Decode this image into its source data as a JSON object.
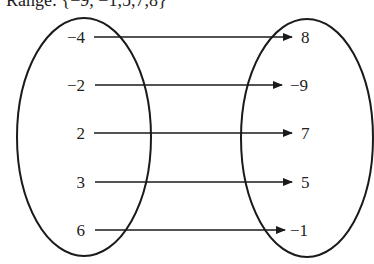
{
  "header": {
    "text": "Range: {−9, −1,5,7,8}"
  },
  "diagram": {
    "type": "mapping-diagram",
    "domain_set": {
      "label": "Domain",
      "values": [
        "−4",
        "−2",
        "2",
        "3",
        "6"
      ]
    },
    "range_set": {
      "label": "Range",
      "values": [
        "8",
        "−9",
        "7",
        "5",
        "−1"
      ]
    },
    "mappings": [
      {
        "from": "−4",
        "to": "8"
      },
      {
        "from": "−2",
        "to": "−9"
      },
      {
        "from": "2",
        "to": "7"
      },
      {
        "from": "3",
        "to": "5"
      },
      {
        "from": "6",
        "to": "−1"
      }
    ],
    "colors": {
      "stroke": "#1a1a1a",
      "background": "#ffffff"
    }
  }
}
